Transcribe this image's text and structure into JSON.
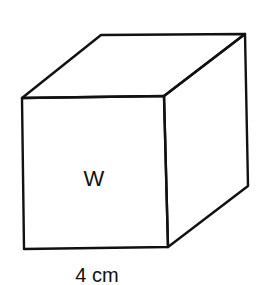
{
  "figure": {
    "type": "cube",
    "face_label": "W",
    "dimension_label": "4 cm",
    "stroke_color": "#111111",
    "background": "#ffffff"
  }
}
